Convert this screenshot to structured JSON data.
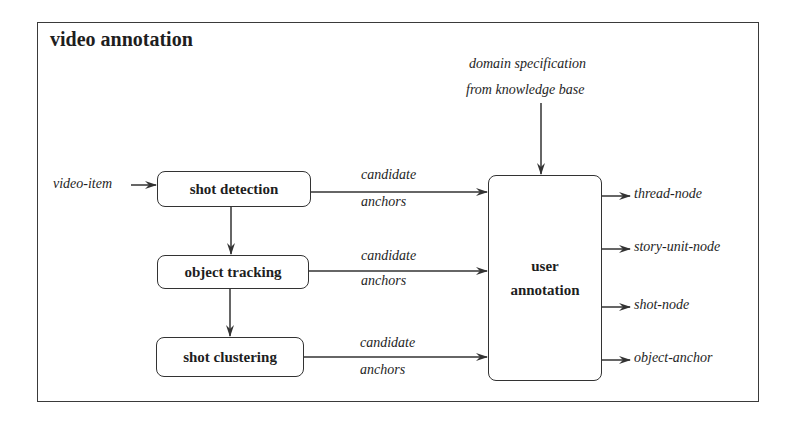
{
  "diagram": {
    "title": "video annotation",
    "input": {
      "label": "video-item"
    },
    "knowledge_source": {
      "line1": "domain specification",
      "line2": "from knowledge base"
    },
    "processes": [
      {
        "id": "shot-detection",
        "label": "shot detection"
      },
      {
        "id": "object-tracking",
        "label": "object tracking"
      },
      {
        "id": "shot-clustering",
        "label": "shot clustering"
      }
    ],
    "edges_to_user": [
      {
        "line1": "candidate",
        "line2": "anchors"
      },
      {
        "line1": "candidate",
        "line2": "anchors"
      },
      {
        "line1": "candidate",
        "line2": "anchors"
      }
    ],
    "user_annotation": {
      "line1": "user",
      "line2": "annotation"
    },
    "outputs": [
      {
        "label": "thread-node"
      },
      {
        "label": "story-unit-node"
      },
      {
        "label": "shot-node"
      },
      {
        "label": "object-anchor"
      }
    ],
    "colors": {
      "line": "#333333",
      "text": "#1e1e1e",
      "background": "#ffffff"
    }
  }
}
